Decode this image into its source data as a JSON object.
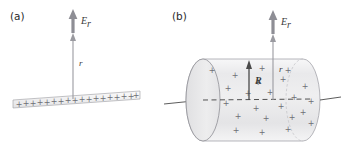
{
  "figure": {
    "background_color": "#ffffff",
    "panels": [
      {
        "id": "a",
        "label": "(a)",
        "label_x": 10,
        "label_y": 20,
        "description": "Infinite line of positive charge with radial electric field vector"
      },
      {
        "id": "b",
        "label": "(b)",
        "label_x": 172,
        "label_y": 20,
        "description": "Uniformly charged cylinder of radius R with radial electric field vector at distance r"
      }
    ],
    "labels": {
      "field_symbol": "E",
      "field_subscript": "r",
      "distance_symbol": "r",
      "radius_symbol": "R"
    },
    "colors": {
      "charge_gray": "#6f6f76",
      "arrow_gray": "#8a8a90",
      "outline_gray": "#7b7b82",
      "text_dark": "#2b2b2b",
      "text_gray": "#3a3a3a",
      "cylinder_fill": "#ededee",
      "cap_fill": "#e6e6e7",
      "strip_fill": "#f0f0f1",
      "axis_line": "#4a4a4a"
    },
    "panel_a": {
      "line_start_x": 13,
      "line_start_y": 104,
      "line_end_x": 140,
      "line_end_y": 95,
      "charge_count": 19,
      "charge_label": "+",
      "field_arrow": {
        "x": 73,
        "y_tail": 33,
        "y_head": 12
      },
      "r_arrow": {
        "x": 73,
        "y_tail": 99,
        "y_head": 36
      },
      "r_label_x": 79,
      "r_label_y": 66,
      "E_label_x": 81,
      "E_label_y": 24
    },
    "panel_b": {
      "cylinder_left_x": 186,
      "cylinder_right_x": 320,
      "cylinder_top_y": 59,
      "cylinder_bottom_y": 141,
      "cap_rx": 17,
      "cap_ry": 41,
      "axis_y": 100,
      "axis_left_end_x": 164,
      "axis_right_end_x": 341,
      "charge_count": 23,
      "charge_label": "+",
      "R_arrow": {
        "x": 249,
        "y_tail": 100,
        "y_head": 61
      },
      "R_label_x": 255,
      "R_label_y": 83,
      "field_arrow": {
        "x": 273,
        "y_tail": 34,
        "y_head": 12
      },
      "r_arrow": {
        "x": 273,
        "y_tail": 100,
        "y_head": 37
      },
      "r_label_x": 279,
      "r_label_y": 72,
      "E_label_x": 281,
      "E_label_y": 25
    }
  }
}
